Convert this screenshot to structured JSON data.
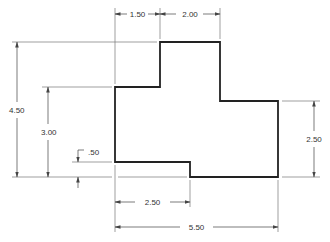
{
  "drawing": {
    "type": "dimensioned-part-outline",
    "colors": {
      "outline": "#222222",
      "dimension": "#555555",
      "text": "#333333",
      "background": "#ffffff"
    },
    "dimensions": {
      "top_left_width": "1.50",
      "top_right_width": "2.00",
      "overall_height": "4.50",
      "left_step_height": "3.00",
      "bottom_step_offset": ".50",
      "right_height": "2.50",
      "bottom_left_width": "2.50",
      "overall_width": "5.50"
    }
  }
}
